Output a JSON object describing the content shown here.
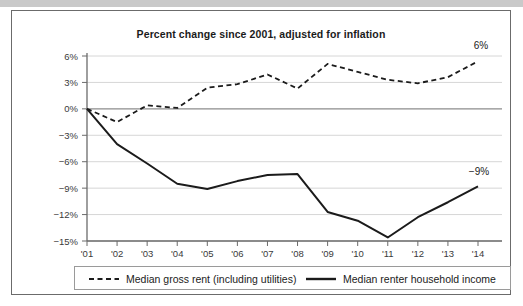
{
  "figure": {
    "title": "Percent change since 2001, adjusted for inflation"
  },
  "legend": {
    "items": [
      {
        "label": "Median gross rent (including utilities)",
        "style": "dashed",
        "color": "#1b1b1b"
      },
      {
        "label": "Median renter household income",
        "style": "solid",
        "color": "#1b1b1b"
      }
    ]
  },
  "annotations": {
    "rent_end_label": "6%",
    "income_end_label": "−9%"
  },
  "colors": {
    "line": "#1b1b1b",
    "gridline": "#d6d6d6",
    "zero_line": "#8c8c8c",
    "axis": "#6b6b6b",
    "frame": "#6b6b6b",
    "top_band": "#c9c9c9",
    "text": "#1b1b1b",
    "tick_text": "#3a3a3a"
  },
  "chart_data": {
    "type": "line",
    "title": "Percent change since 2001, adjusted for inflation",
    "xlabel": "",
    "ylabel": "",
    "x": [
      "'01",
      "'02",
      "'03",
      "'04",
      "'05",
      "'06",
      "'07",
      "'08",
      "'09",
      "'10",
      "'11",
      "'12",
      "'13",
      "'14"
    ],
    "categories": [
      "'01",
      "'02",
      "'03",
      "'04",
      "'05",
      "'06",
      "'07",
      "'08",
      "'09",
      "'10",
      "'11",
      "'12",
      "'13",
      "'14"
    ],
    "xtick_labels": [
      "'01",
      "'02",
      "'03",
      "'04",
      "'05",
      "'06",
      "'07",
      "'08",
      "'09",
      "'10",
      "'11",
      "'12",
      "'13",
      "'14"
    ],
    "ytick_labels": [
      "6%",
      "3%",
      "0%",
      "−3%",
      "−6%",
      "−9%",
      "−12%",
      "−15%"
    ],
    "ytick_values": [
      6,
      3,
      0,
      -3,
      -6,
      -9,
      -12,
      -15
    ],
    "ylim": [
      -15,
      6
    ],
    "grid": true,
    "legend_position": "bottom",
    "series": [
      {
        "name": "Median gross rent (including utilities)",
        "style": "dashed",
        "values": [
          0.0,
          -1.5,
          0.4,
          0.1,
          2.4,
          2.8,
          3.9,
          2.3,
          5.1,
          4.2,
          3.3,
          2.9,
          3.6,
          5.4
        ],
        "end_label": "6%"
      },
      {
        "name": "Median renter household income",
        "style": "solid",
        "values": [
          0.0,
          -4.0,
          -6.2,
          -8.5,
          -9.1,
          -8.2,
          -7.5,
          -7.4,
          -11.7,
          -12.7,
          -14.6,
          -12.3,
          -10.6,
          -8.8
        ],
        "end_label": "−9%"
      }
    ]
  }
}
